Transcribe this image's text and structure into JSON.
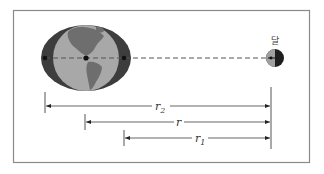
{
  "diagram": {
    "labels": {
      "moon": "달",
      "r2": "r",
      "r2_sub": "2",
      "r": "r",
      "r1": "r",
      "r1_sub": "1"
    },
    "colors": {
      "frame": "#8a8a8a",
      "bulge": "#3d3d3d",
      "globe": "#a8a8a8",
      "land": "#6e6e6e",
      "line": "#555555",
      "moon_dark": "#1e1e1e",
      "moon_light": "#a0a0a0"
    },
    "distances": [
      {
        "name": "r2",
        "from": "far side of Earth",
        "to": "Moon"
      },
      {
        "name": "r",
        "from": "Earth center",
        "to": "Moon"
      },
      {
        "name": "r1",
        "from": "near side of Earth",
        "to": "Moon"
      }
    ]
  }
}
